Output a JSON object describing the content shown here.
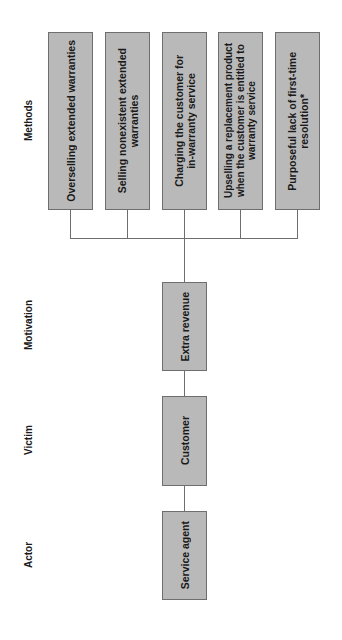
{
  "diagram": {
    "orientation": "rotated-90-ccw",
    "colors": {
      "box_fill": "#b9b9b9",
      "box_border": "#6e6e6e",
      "connector": "#6e6e6e",
      "text": "#1a1a1a"
    },
    "row_labels": {
      "methods": "Methods",
      "motivation": "Motivation",
      "victim": "Victim",
      "actor": "Actor"
    },
    "methods": [
      {
        "label": "Overselling extended warranties"
      },
      {
        "label": "Selling nonexistent extended\nwarranties"
      },
      {
        "label": "Charging the customer for\nin-warranty service"
      },
      {
        "label": "Upselling a replacement product\nwhen the customer is entitled to\nwarranty service"
      },
      {
        "label": "Purposeful lack of first-time\nresolution*"
      }
    ],
    "motivation": {
      "label": "Extra revenue"
    },
    "victim": {
      "label": "Customer"
    },
    "actor": {
      "label": "Service agent"
    }
  }
}
